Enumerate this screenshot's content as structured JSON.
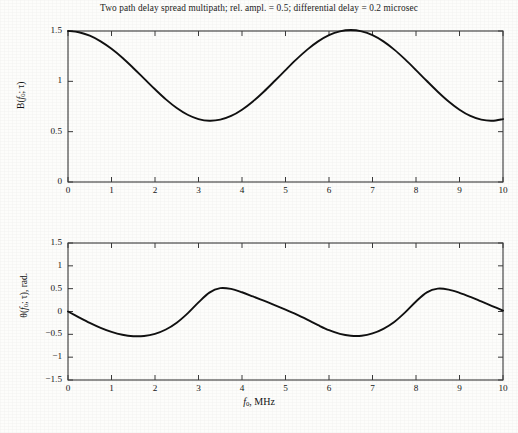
{
  "figure": {
    "title": "Two path delay spread multipath; rel. ampl. = 0.5; differential delay = 0.2 microsec",
    "xlabel_main": "f",
    "xlabel_sub": "0",
    "xlabel_rest": ", MHz",
    "line_color": "#111111",
    "axis_color": "#3a3a3a",
    "background": "#fdfdfb"
  },
  "chart_data": [
    {
      "type": "line",
      "title": "Two path delay spread multipath; rel. ampl. = 0.5; differential delay = 0.2 microsec",
      "panel": "magnitude",
      "xlabel": "f0, MHz",
      "ylabel": "B(f0; τ)",
      "xlim": [
        0,
        10
      ],
      "ylim": [
        0,
        1.5
      ],
      "xticks": [
        0,
        1,
        2,
        3,
        4,
        5,
        6,
        7,
        8,
        9,
        10
      ],
      "xticklabels": [
        "0",
        "1",
        "2",
        "3",
        "4",
        "5",
        "6",
        "7",
        "8",
        "9",
        "10"
      ],
      "yticks": [
        0,
        0.5,
        1,
        1.5
      ],
      "yticklabels": [
        "0",
        "0.5",
        "1",
        "1.5"
      ],
      "grid": false,
      "legend": null,
      "model": "B(f) = |1 + a*exp(-j*2*pi*f*tau)| with a = 0.5, tau = 0.2 microsec",
      "parameters": {
        "relative_amplitude": 0.5,
        "differential_delay_microsec": 0.2,
        "period_mhz": 5
      },
      "annotations": [
        {
          "label": "maximum",
          "x": 0,
          "y": 1.5
        },
        {
          "label": "minimum",
          "x": 2.5,
          "y": 0.47
        },
        {
          "label": "maximum",
          "x": 5,
          "y": 1.5
        },
        {
          "label": "minimum",
          "x": 7.5,
          "y": 0.46
        },
        {
          "label": "endpoint",
          "x": 10,
          "y": 1.47
        }
      ],
      "x": [
        0,
        0.25,
        0.5,
        0.75,
        1,
        1.25,
        1.5,
        1.75,
        2,
        2.25,
        2.5,
        2.75,
        3,
        3.25,
        3.5,
        3.75,
        4,
        4.25,
        4.5,
        4.75,
        5,
        5.25,
        5.5,
        5.75,
        6,
        6.25,
        6.5,
        6.75,
        7,
        7.25,
        7.5,
        7.75,
        8,
        8.25,
        8.5,
        8.75,
        9,
        9.25,
        9.5,
        9.75,
        10
      ],
      "values": [
        1.5,
        1.488,
        1.453,
        1.397,
        1.323,
        1.234,
        1.133,
        1.027,
        0.921,
        0.821,
        0.735,
        0.668,
        0.625,
        0.608,
        0.619,
        0.656,
        0.718,
        0.8,
        0.897,
        1.003,
        1.112,
        1.218,
        1.315,
        1.397,
        1.459,
        1.497,
        1.51,
        1.497,
        1.459,
        1.397,
        1.315,
        1.218,
        1.112,
        1.003,
        0.897,
        0.8,
        0.718,
        0.656,
        0.619,
        0.608,
        0.625
      ]
    },
    {
      "type": "line",
      "panel": "phase",
      "xlabel": "f0, MHz",
      "ylabel": "θ(f0; τ), rad.",
      "xlim": [
        0,
        10
      ],
      "ylim": [
        -1.5,
        1.5
      ],
      "xticks": [
        0,
        1,
        2,
        3,
        4,
        5,
        6,
        7,
        8,
        9,
        10
      ],
      "xticklabels": [
        "0",
        "1",
        "2",
        "3",
        "4",
        "5",
        "6",
        "7",
        "8",
        "9",
        "10"
      ],
      "yticks": [
        -1.5,
        -1,
        -0.5,
        0,
        0.5,
        1,
        1.5
      ],
      "yticklabels": [
        "−1.5",
        "−1",
        "−0.5",
        "0",
        "0.5",
        "1",
        "1.5"
      ],
      "grid": false,
      "legend": null,
      "model": "theta(f) = -arg(1 + a*exp(-j*2*pi*f*tau)) with a = 0.5, tau = 0.2 microsec",
      "parameters": {
        "relative_amplitude": 0.5,
        "differential_delay_microsec": 0.2,
        "period_mhz": 5
      },
      "annotations": [
        {
          "label": "zero crossing",
          "x": 0,
          "y": 0
        },
        {
          "label": "minimum",
          "x": 1.8,
          "y": -0.53
        },
        {
          "label": "maximum",
          "x": 3.3,
          "y": 0.48
        },
        {
          "label": "zero crossing",
          "x": 5,
          "y": 0
        },
        {
          "label": "minimum",
          "x": 6.8,
          "y": -0.53
        },
        {
          "label": "maximum",
          "x": 8.3,
          "y": 0.45
        },
        {
          "label": "endpoint",
          "x": 10,
          "y": -0.1
        }
      ],
      "x": [
        0,
        0.25,
        0.5,
        0.75,
        1,
        1.25,
        1.5,
        1.75,
        2,
        2.25,
        2.5,
        2.75,
        3,
        3.25,
        3.5,
        3.75,
        4,
        4.25,
        4.5,
        4.75,
        5,
        5.25,
        5.5,
        5.75,
        6,
        6.25,
        6.5,
        6.75,
        7,
        7.25,
        7.5,
        7.75,
        8,
        8.25,
        8.5,
        8.75,
        9,
        9.25,
        9.5,
        9.75,
        10
      ],
      "values": [
        0,
        -0.127,
        -0.249,
        -0.358,
        -0.447,
        -0.51,
        -0.541,
        -0.536,
        -0.489,
        -0.394,
        -0.245,
        -0.04,
        0.2,
        0.414,
        0.511,
        0.494,
        0.421,
        0.33,
        0.236,
        0.14,
        0.04,
        -0.065,
        -0.18,
        -0.3,
        -0.41,
        -0.49,
        -0.53,
        -0.53,
        -0.48,
        -0.38,
        -0.23,
        -0.02,
        0.22,
        0.42,
        0.5,
        0.48,
        0.41,
        0.32,
        0.22,
        0.12,
        0.02
      ]
    }
  ],
  "panels": {
    "magnitude": {
      "ylabel_main": "B(",
      "ylabel_var": "f",
      "ylabel_sub": "0",
      "ylabel_tail": "; τ)"
    },
    "phase": {
      "ylabel_main": "θ(",
      "ylabel_var": "f",
      "ylabel_sub": "0",
      "ylabel_tail": "; τ), rad."
    }
  }
}
